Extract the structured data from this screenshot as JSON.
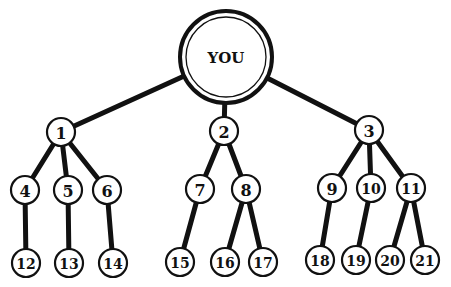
{
  "diagram": {
    "type": "tree",
    "root": {
      "id": "you",
      "label": "YOU",
      "x": 226,
      "y": 57,
      "r": 46,
      "inner_r": 40
    },
    "colors": {
      "stroke": "#111111",
      "fill": "#ffffff",
      "background": "#ffffff"
    },
    "node_radius": 14,
    "leaf_radius": 14,
    "nodes": [
      {
        "id": "1",
        "label": "1",
        "x": 61,
        "y": 132,
        "parent": "you"
      },
      {
        "id": "2",
        "label": "2",
        "x": 224,
        "y": 131,
        "parent": "you"
      },
      {
        "id": "3",
        "label": "3",
        "x": 369,
        "y": 130,
        "parent": "you"
      },
      {
        "id": "4",
        "label": "4",
        "x": 25,
        "y": 190,
        "parent": "1"
      },
      {
        "id": "5",
        "label": "5",
        "x": 68,
        "y": 190,
        "parent": "1"
      },
      {
        "id": "6",
        "label": "6",
        "x": 107,
        "y": 190,
        "parent": "1"
      },
      {
        "id": "7",
        "label": "7",
        "x": 200,
        "y": 189,
        "parent": "2"
      },
      {
        "id": "8",
        "label": "8",
        "x": 246,
        "y": 189,
        "parent": "2"
      },
      {
        "id": "9",
        "label": "9",
        "x": 332,
        "y": 188,
        "parent": "3"
      },
      {
        "id": "10",
        "label": "10",
        "x": 371,
        "y": 188,
        "parent": "3"
      },
      {
        "id": "11",
        "label": "11",
        "x": 411,
        "y": 188,
        "parent": "3"
      },
      {
        "id": "12",
        "label": "12",
        "x": 26,
        "y": 263,
        "parent": "4"
      },
      {
        "id": "13",
        "label": "13",
        "x": 69,
        "y": 263,
        "parent": "5"
      },
      {
        "id": "14",
        "label": "14",
        "x": 113,
        "y": 263,
        "parent": "6"
      },
      {
        "id": "15",
        "label": "15",
        "x": 180,
        "y": 262,
        "parent": "7"
      },
      {
        "id": "16",
        "label": "16",
        "x": 225,
        "y": 262,
        "parent": "8"
      },
      {
        "id": "17",
        "label": "17",
        "x": 263,
        "y": 262,
        "parent": "8"
      },
      {
        "id": "18",
        "label": "18",
        "x": 320,
        "y": 260,
        "parent": "9"
      },
      {
        "id": "19",
        "label": "19",
        "x": 356,
        "y": 260,
        "parent": "10"
      },
      {
        "id": "20",
        "label": "20",
        "x": 390,
        "y": 260,
        "parent": "11"
      },
      {
        "id": "21",
        "label": "21",
        "x": 425,
        "y": 260,
        "parent": "11"
      }
    ]
  }
}
